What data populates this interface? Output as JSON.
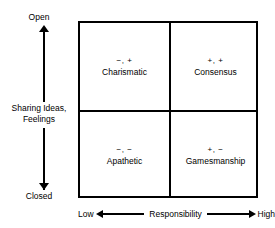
{
  "chart_data": {
    "type": "scatter",
    "title": "",
    "xlabel": "Responsibility",
    "ylabel": "Sharing Ideas, Feelings",
    "x_axis": {
      "label": "Responsibility",
      "low_label": "Low",
      "high_label": "High",
      "arrow": "double"
    },
    "y_axis": {
      "label_line1": "Sharing Ideas,",
      "label_line2": "Feelings",
      "top_label": "Open",
      "bottom_label": "Closed",
      "arrow": "double"
    },
    "grid": false,
    "legend": "none",
    "quadrants": [
      {
        "position": "top-left",
        "signs": "−, +",
        "name": "Charismatic",
        "x_value": "low",
        "y_value": "open"
      },
      {
        "position": "top-right",
        "signs": "+, +",
        "name": "Consensus",
        "x_value": "high",
        "y_value": "open"
      },
      {
        "position": "bottom-left",
        "signs": "−, −",
        "name": "Apathetic",
        "x_value": "low",
        "y_value": "closed"
      },
      {
        "position": "bottom-right",
        "signs": "+, −",
        "name": "Gamesmanship",
        "x_value": "high",
        "y_value": "closed"
      }
    ],
    "colors": {
      "border": "#000000",
      "background": "#ffffff",
      "text": "#000000"
    }
  }
}
